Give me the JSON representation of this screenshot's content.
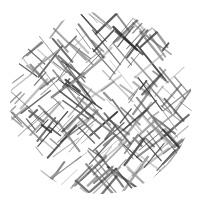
{
  "image": {
    "description": "Circular crosshatch texture of diagonal gray strokes on white background",
    "width": 200,
    "height": 204,
    "background": "#ffffff",
    "circle": {
      "cx": 101,
      "cy": 103,
      "r": 91
    },
    "stroke_colors": [
      "#2a2a2a",
      "#444444",
      "#5e5e5e",
      "#7a7a7a",
      "#999999"
    ],
    "line_count": 260,
    "seed": 7
  }
}
